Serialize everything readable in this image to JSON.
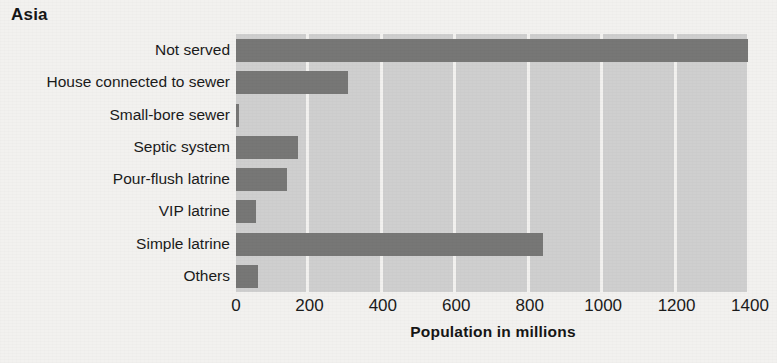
{
  "chart_data": {
    "type": "bar",
    "orientation": "horizontal",
    "title": "Asia",
    "xlabel": "Population in millions",
    "ylabel": "",
    "xlim": [
      0,
      1400
    ],
    "xticks": [
      0,
      200,
      400,
      600,
      800,
      1000,
      1200,
      1400
    ],
    "xtick_labels": [
      "0",
      "200",
      "400",
      "600",
      "800",
      "1000",
      "1200",
      "1400"
    ],
    "grid": "vertical",
    "legend": "none",
    "categories": [
      "Not served",
      "House connected to sewer",
      "Small-bore sewer",
      "Septic system",
      "Pour-flush latrine",
      "VIP latrine",
      "Simple latrine",
      "Others"
    ],
    "values": [
      1395,
      305,
      8,
      170,
      140,
      55,
      835,
      60
    ],
    "bar_color": "#777776",
    "plot_background": "#cfcfcf",
    "figure_background": "#f2f1ef"
  }
}
